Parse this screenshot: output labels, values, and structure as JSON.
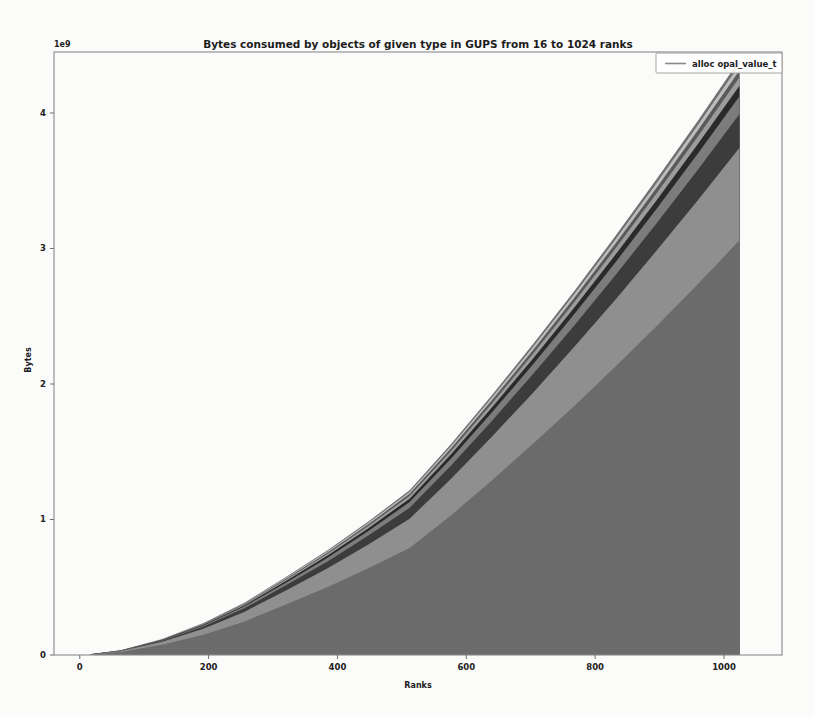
{
  "figure": {
    "title": "Bytes consumed by objects of given type in GUPS from 16 to 1024 ranks",
    "legend": {
      "entries": [
        "alloc opal_value_t"
      ],
      "position": "upper right"
    }
  },
  "axes": {
    "x": {
      "label": "Ranks",
      "ticks": [
        "0",
        "200",
        "400",
        "600",
        "800",
        "1000"
      ]
    },
    "y": {
      "label": "Bytes",
      "ticks": [
        "0",
        "1",
        "2",
        "3",
        "4"
      ],
      "exponent": "1e9"
    }
  },
  "chart_data": {
    "type": "area",
    "title": "Bytes consumed by objects of given type in GUPS from 16 to 1024 ranks",
    "xlabel": "Ranks",
    "ylabel": "Bytes",
    "y_exponent": "1e9",
    "xlim": [
      -40,
      1090
    ],
    "ylim": [
      0,
      4450000000
    ],
    "xticks": [
      0,
      200,
      400,
      600,
      800,
      1000
    ],
    "yticks": [
      0,
      1000000000,
      2000000000,
      3000000000,
      4000000000
    ],
    "grid": false,
    "legend": [
      "alloc opal_value_t"
    ],
    "stacked": true,
    "x": [
      16,
      64,
      128,
      192,
      256,
      320,
      384,
      448,
      512,
      576,
      640,
      704,
      768,
      832,
      896,
      960,
      1024
    ],
    "series": [
      {
        "name": "alloc opal_value_t",
        "color": "#6b6b6b",
        "values": [
          3000000,
          22000000,
          75000000,
          150000000,
          248000000,
          372000000,
          500000000,
          640000000,
          790000000,
          1030000000,
          1290000000,
          1560000000,
          1840000000,
          2130000000,
          2430000000,
          2740000000,
          3060000000
        ]
      },
      {
        "name": "band-2",
        "color": "#8f8f8f",
        "values": [
          1000000,
          7000000,
          22000000,
          44000000,
          72000000,
          104000000,
          138000000,
          176000000,
          216000000,
          268000000,
          322000000,
          378000000,
          436000000,
          496000000,
          558000000,
          620000000,
          684000000
        ]
      },
      {
        "name": "band-3",
        "color": "#3c3c3c",
        "values": [
          400000,
          2600000,
          8000000,
          16000000,
          26000000,
          38000000,
          51000000,
          65000000,
          80000000,
          98000000,
          117000000,
          137000000,
          158000000,
          180000000,
          202000000,
          225000000,
          248000000
        ]
      },
      {
        "name": "band-4",
        "color": "#7c7c7c",
        "values": [
          200000,
          1400000,
          4200000,
          8400000,
          13800000,
          20000000,
          27000000,
          34500000,
          42500000,
          52000000,
          62000000,
          72500000,
          83500000,
          95000000,
          107000000,
          119000000,
          131000000
        ]
      },
      {
        "name": "band-5",
        "color": "#2a2a2a",
        "values": [
          120000,
          800000,
          2500000,
          5000000,
          8200000,
          12000000,
          16000000,
          20500000,
          25000000,
          31000000,
          37000000,
          43000000,
          49500000,
          56500000,
          63500000,
          70500000,
          78000000
        ]
      },
      {
        "name": "band-6",
        "color": "#9c9c9c",
        "values": [
          100000,
          640000,
          2000000,
          4000000,
          6600000,
          9600000,
          12800000,
          16400000,
          20200000,
          24800000,
          29600000,
          34600000,
          39800000,
          45200000,
          50800000,
          56400000,
          62200000
        ]
      },
      {
        "name": "band-7",
        "color": "#5a5a5a",
        "values": [
          80000,
          520000,
          1600000,
          3200000,
          5300000,
          7700000,
          10300000,
          13100000,
          16200000,
          19900000,
          23800000,
          27800000,
          32000000,
          36400000,
          40800000,
          45400000,
          50000000
        ]
      },
      {
        "name": "band-8",
        "color": "#bdbdbd",
        "values": [
          70000,
          430000,
          1350000,
          2700000,
          4450000,
          6450000,
          8650000,
          11050000,
          13600000,
          16700000,
          19950000,
          23350000,
          26850000,
          30550000,
          34300000,
          38100000,
          42000000
        ]
      },
      {
        "name": "band-9",
        "color": "#707070",
        "values": [
          60000,
          360000,
          1150000,
          2300000,
          3800000,
          5500000,
          7400000,
          9450000,
          11600000,
          14250000,
          17050000,
          19950000,
          22950000,
          26100000,
          29300000,
          32550000,
          35900000
        ]
      }
    ]
  }
}
